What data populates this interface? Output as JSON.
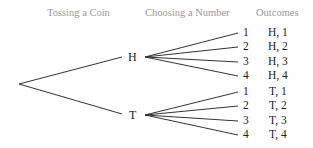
{
  "headers": {
    "col1": "Tossing a Coin",
    "col2": "Choosing a Number",
    "col3": "Outcomes"
  },
  "coin": {
    "heads": "H",
    "tails": "T"
  },
  "branches": [
    {
      "number": "1",
      "outcome": "H, 1"
    },
    {
      "number": "2",
      "outcome": "H, 2"
    },
    {
      "number": "3",
      "outcome": "H, 3"
    },
    {
      "number": "4",
      "outcome": "H, 4"
    },
    {
      "number": "1",
      "outcome": "T, 1"
    },
    {
      "number": "2",
      "outcome": "T, 2"
    },
    {
      "number": "3",
      "outcome": "T, 3"
    },
    {
      "number": "4",
      "outcome": "T, 4"
    }
  ]
}
